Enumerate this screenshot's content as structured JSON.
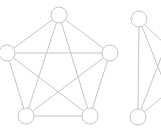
{
  "figure": {
    "background_color": "#ffffff",
    "edge_color": "#b9b9b9",
    "node_stroke_color": "#bdbdbd",
    "node_fill_color": "#ffffff",
    "node_radius": 8,
    "edge_width": 0.85,
    "width": 161,
    "height": 133
  },
  "chart_data": {
    "type": "diagram",
    "diagram_type": "node-link-graph",
    "graphs": [
      {
        "id": "graph-left",
        "name": "complete-graph-k5",
        "description": "Complete graph on five vertices arranged as a pentagon with all diagonals drawn",
        "node_count": 5,
        "edge_count": 10,
        "nodes": [
          {
            "id": "L1",
            "label": "",
            "cx": 59,
            "cy": 15,
            "r": 8
          },
          {
            "id": "L2",
            "label": "",
            "cx": 110,
            "cy": 53,
            "r": 8
          },
          {
            "id": "L3",
            "label": "",
            "cx": 90,
            "cy": 116,
            "r": 8
          },
          {
            "id": "L4",
            "label": "",
            "cx": 26,
            "cy": 116,
            "r": 8
          },
          {
            "id": "L5",
            "label": "",
            "cx": 7,
            "cy": 53,
            "r": 8
          }
        ],
        "edges": [
          {
            "source": "L1",
            "target": "L2"
          },
          {
            "source": "L1",
            "target": "L3"
          },
          {
            "source": "L1",
            "target": "L4"
          },
          {
            "source": "L1",
            "target": "L5"
          },
          {
            "source": "L2",
            "target": "L3"
          },
          {
            "source": "L2",
            "target": "L4"
          },
          {
            "source": "L2",
            "target": "L5"
          },
          {
            "source": "L3",
            "target": "L4"
          },
          {
            "source": "L3",
            "target": "L5"
          },
          {
            "source": "L4",
            "target": "L5"
          }
        ]
      },
      {
        "id": "graph-right",
        "name": "partial-graph-clipped",
        "description": "Partially visible graph at the right edge: two visible vertices joined by a vertical edge, plus four edges running off the right border toward off-screen vertices",
        "node_count": 2,
        "visible_edge_count": 5,
        "clipped": true,
        "nodes": [
          {
            "id": "R1",
            "label": "",
            "cx": 139,
            "cy": 19,
            "r": 8
          },
          {
            "id": "R2",
            "label": "",
            "cx": 138,
            "cy": 117,
            "r": 8
          }
        ],
        "edges": [
          {
            "source": "R1",
            "target": "R2"
          },
          {
            "source": "R1",
            "target": "OFF_A",
            "clipped": true
          },
          {
            "source": "R1",
            "target": "OFF_B",
            "clipped": true
          },
          {
            "source": "R2",
            "target": "OFF_A",
            "clipped": true
          },
          {
            "source": "R2",
            "target": "OFF_B",
            "clipped": true
          }
        ],
        "offscreen_anchors": [
          {
            "id": "OFF_A",
            "x": 166,
            "y": 45
          },
          {
            "id": "OFF_B",
            "x": 168,
            "y": 92
          }
        ]
      }
    ]
  }
}
